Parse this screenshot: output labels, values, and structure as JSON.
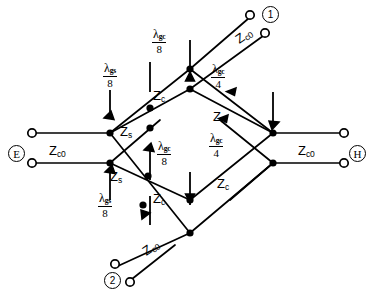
{
  "figure": {
    "kind": "waveguide-network-schematic",
    "width": 371,
    "height": 297,
    "background": "#ffffff",
    "line_color": "#000000"
  },
  "ports": [
    {
      "id": "E",
      "label": "E",
      "style": "circled-letter",
      "position": "left",
      "terminals": 2
    },
    {
      "id": "H",
      "label": "H",
      "style": "circled-letter",
      "position": "right",
      "terminals": 2
    },
    {
      "id": "P1",
      "label": "1",
      "style": "circled-number",
      "position": "top-right",
      "terminals": 2
    },
    {
      "id": "P2",
      "label": "2",
      "style": "circled-number",
      "position": "bottom-left",
      "terminals": 2
    }
  ],
  "impedances": {
    "zc0": {
      "base": "Z",
      "sub": "c0"
    },
    "zs": {
      "base": "Z",
      "sub": "s"
    },
    "zc": {
      "base": "Z",
      "sub": "c"
    }
  },
  "impedance_labels": [
    {
      "id": "zc0-left",
      "base": "Z",
      "sub": "c0",
      "x": 49,
      "y": 144,
      "rot": 0
    },
    {
      "id": "zc0-right",
      "base": "Z",
      "sub": "c0",
      "x": 298,
      "y": 144,
      "rot": 0
    },
    {
      "id": "zc0-top-right",
      "base": "Z",
      "sub": "c0",
      "x": 233,
      "y": 35,
      "rot": -35
    },
    {
      "id": "zc0-bottom-left",
      "base": "Z",
      "sub": "c0",
      "x": 140,
      "y": 247,
      "rot": -35
    },
    {
      "id": "zs-upper",
      "base": "Z",
      "sub": "s",
      "x": 120,
      "y": 125,
      "rot": 0
    },
    {
      "id": "zs-lower",
      "base": "Z",
      "sub": "s",
      "x": 110,
      "y": 170,
      "rot": 0
    },
    {
      "id": "zc-upper-left",
      "base": "Z",
      "sub": "c",
      "x": 153,
      "y": 89,
      "rot": 0
    },
    {
      "id": "zc-upper-right",
      "base": "Z",
      "sub": "c",
      "x": 213,
      "y": 110,
      "rot": 0
    },
    {
      "id": "zc-lower-left",
      "base": "Z",
      "sub": "c",
      "x": 153,
      "y": 192,
      "rot": 0
    },
    {
      "id": "zc-lower-right",
      "base": "Z",
      "sub": "c",
      "x": 217,
      "y": 177,
      "rot": 0
    }
  ],
  "dimension_labels": [
    {
      "id": "lam-gs-8-upper",
      "lam": "λ",
      "gsub": "gs",
      "den": "8",
      "x": 103,
      "y": 62
    },
    {
      "id": "lam-gc-8-top",
      "lam": "λ",
      "gsub": "gc",
      "den": "8",
      "x": 152,
      "y": 28
    },
    {
      "id": "lam-gc-4-upper",
      "lam": "λ",
      "gsub": "gc",
      "den": "4",
      "x": 211,
      "y": 63
    },
    {
      "id": "lam-gc-8-mid",
      "lam": "λ",
      "gsub": "gc",
      "den": "8",
      "x": 157,
      "y": 140
    },
    {
      "id": "lam-gc-4-lower",
      "lam": "λ",
      "gsub": "gc",
      "den": "4",
      "x": 209,
      "y": 132
    },
    {
      "id": "lam-gs-8-lower",
      "lam": "λ",
      "gsub": "gs",
      "den": "8",
      "x": 98,
      "y": 192
    }
  ],
  "geometry": {
    "nodes": [
      {
        "id": "n-left-top",
        "x": 110,
        "y": 133,
        "filled": true
      },
      {
        "id": "n-left-bot",
        "x": 110,
        "y": 163,
        "filled": true
      },
      {
        "id": "n-right-top",
        "x": 273,
        "y": 133,
        "filled": true
      },
      {
        "id": "n-right-bot",
        "x": 273,
        "y": 163,
        "filled": true
      },
      {
        "id": "n-top-apex",
        "x": 190,
        "y": 69,
        "filled": true
      },
      {
        "id": "n-top-inner",
        "x": 190,
        "y": 89,
        "filled": true
      },
      {
        "id": "n-bot-inner",
        "x": 190,
        "y": 200,
        "filled": true
      },
      {
        "id": "n-bot-apex",
        "x": 190,
        "y": 233,
        "filled": true
      },
      {
        "id": "n-ul-mid",
        "x": 150,
        "y": 108,
        "filled": true
      },
      {
        "id": "n-ul-low",
        "x": 150,
        "y": 128,
        "filled": true
      },
      {
        "id": "n-ll-mid",
        "x": 148,
        "y": 176,
        "filled": true
      },
      {
        "id": "n-ll-low",
        "x": 143,
        "y": 205,
        "filled": true
      }
    ],
    "open_terminals": [
      {
        "id": "t-E-top",
        "x": 32,
        "y": 133
      },
      {
        "id": "t-E-bot",
        "x": 32,
        "y": 163
      },
      {
        "id": "t-H-top",
        "x": 344,
        "y": 133
      },
      {
        "id": "t-H-bot",
        "x": 344,
        "y": 163
      },
      {
        "id": "t-1-a",
        "x": 249,
        "y": 15
      },
      {
        "id": "t-1-b",
        "x": 263,
        "y": 33
      },
      {
        "id": "t-2-a",
        "x": 115,
        "y": 264
      },
      {
        "id": "t-2-b",
        "x": 129,
        "y": 282
      }
    ]
  }
}
